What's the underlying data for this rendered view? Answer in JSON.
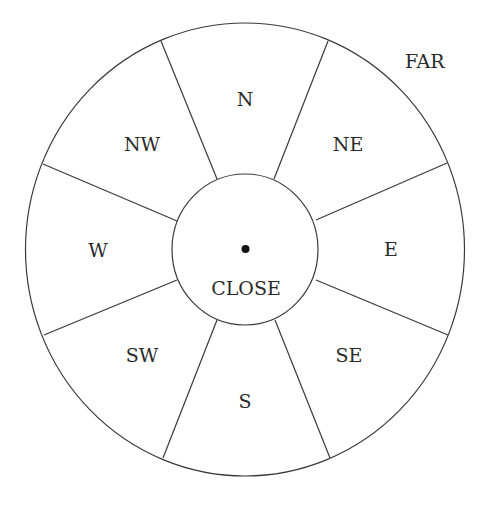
{
  "diagram": {
    "title_label": "FAR",
    "center_label": "CLOSE",
    "center": {
      "x": 245,
      "y": 249.5
    },
    "outer_radius": {
      "rx": 219.5,
      "ry": 226.5
    },
    "inner_radius": {
      "rx": 73,
      "ry": 75.5
    },
    "line_color": "#3a3a3a",
    "text_color": "#2a2a2a",
    "background": "#ffffff",
    "sectors": [
      {
        "id": "n",
        "label": "N",
        "label_pos": {
          "x": 245,
          "y": 99
        }
      },
      {
        "id": "ne",
        "label": "NE",
        "label_pos": {
          "x": 348,
          "y": 144
        }
      },
      {
        "id": "e",
        "label": "E",
        "label_pos": {
          "x": 391,
          "y": 249
        }
      },
      {
        "id": "se",
        "label": "SE",
        "label_pos": {
          "x": 349,
          "y": 355
        }
      },
      {
        "id": "s",
        "label": "S",
        "label_pos": {
          "x": 245,
          "y": 401
        }
      },
      {
        "id": "sw",
        "label": "SW",
        "label_pos": {
          "x": 142,
          "y": 355
        }
      },
      {
        "id": "w",
        "label": "W",
        "label_pos": {
          "x": 98,
          "y": 250
        }
      },
      {
        "id": "nw",
        "label": "NW",
        "label_pos": {
          "x": 142,
          "y": 144
        }
      }
    ],
    "dividers": [
      {
        "from": [
          217,
          179
        ],
        "to": [
          161,
          41
        ]
      },
      {
        "from": [
          274,
          179
        ],
        "to": [
          328,
          41
        ]
      },
      {
        "from": [
          316,
          220
        ],
        "to": [
          447,
          163
        ]
      },
      {
        "from": [
          316,
          280
        ],
        "to": [
          448,
          335
        ]
      },
      {
        "from": [
          275,
          320
        ],
        "to": [
          330,
          458
        ]
      },
      {
        "from": [
          217,
          320
        ],
        "to": [
          163,
          458
        ]
      },
      {
        "from": [
          177,
          280
        ],
        "to": [
          44,
          335
        ]
      },
      {
        "from": [
          177,
          221
        ],
        "to": [
          43,
          164
        ]
      }
    ],
    "far_label_pos": {
      "x": 405,
      "y": 61
    },
    "close_label_pos": {
      "x": 246,
      "y": 288
    },
    "center_dot": {
      "x": 245.5,
      "y": 249,
      "r": 4
    }
  }
}
